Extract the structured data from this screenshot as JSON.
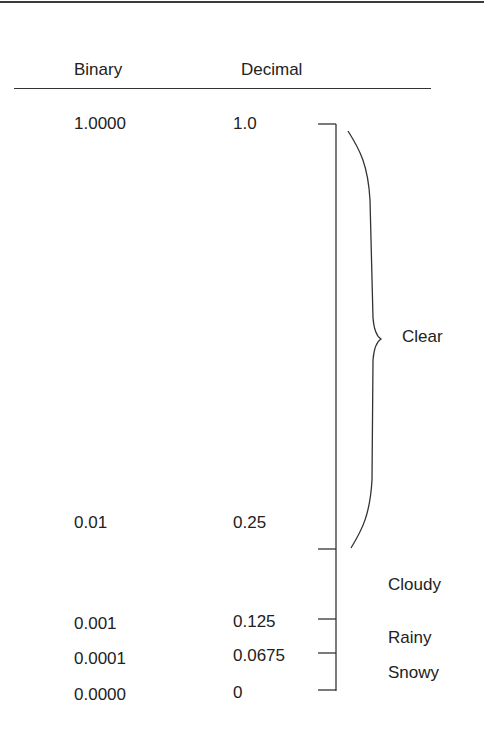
{
  "table": {
    "headers": {
      "binary": "Binary",
      "decimal": "Decimal"
    },
    "rows": [
      {
        "binary": "1.0000",
        "decimal": "1.0"
      },
      {
        "binary": "0.01",
        "decimal": "0.25"
      },
      {
        "binary": "0.001",
        "decimal": "0.125"
      },
      {
        "binary": "0.0001",
        "decimal": "0.0675"
      },
      {
        "binary": "0.0000",
        "decimal": "0"
      }
    ]
  },
  "labels": {
    "clear": "Clear",
    "cloudy": "Cloudy",
    "rainy": "Rainy",
    "snowy": "Snowy"
  },
  "colors": {
    "line": "#333333",
    "text": "#222222"
  }
}
